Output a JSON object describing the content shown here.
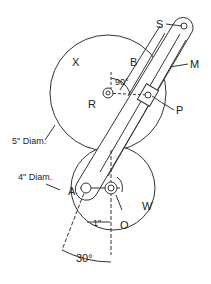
{
  "diagram": {
    "labels": {
      "S": "S",
      "X": "X",
      "B": "B",
      "M": "M",
      "R": "R",
      "P": "P",
      "A": "A",
      "O": "O",
      "W": "W"
    },
    "dimensions": {
      "large_wheel_diameter": "5\" Diam.",
      "small_wheel_diameter": "4\" Diam.",
      "offset": "1\"",
      "angle_top": "90°",
      "angle_bottom": "30°"
    }
  }
}
